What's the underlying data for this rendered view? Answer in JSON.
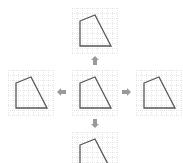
{
  "diagram": {
    "title": "",
    "grid": {
      "cells": 9,
      "cell_size": 5,
      "line_color": "#d8d8d8"
    },
    "shape": {
      "stroke": "#555555",
      "points": [
        [
          8,
          13
        ],
        [
          23,
          7
        ],
        [
          39,
          38
        ],
        [
          8,
          38
        ]
      ]
    },
    "arrow_color": "#9a9a9a",
    "panels": [
      {
        "id": "top",
        "label": "shifted up",
        "x": 72,
        "y": 8
      },
      {
        "id": "left",
        "label": "shifted left",
        "x": 8,
        "y": 70
      },
      {
        "id": "center",
        "label": "original",
        "x": 72,
        "y": 70
      },
      {
        "id": "right",
        "label": "shifted right",
        "x": 136,
        "y": 70
      },
      {
        "id": "bottom",
        "label": "shifted down",
        "x": 72,
        "y": 132
      }
    ],
    "arrows": [
      {
        "id": "up",
        "direction": "up",
        "x": 91,
        "y": 56
      },
      {
        "id": "left",
        "direction": "left",
        "x": 57,
        "y": 88
      },
      {
        "id": "right",
        "direction": "right",
        "x": 122,
        "y": 88
      },
      {
        "id": "down",
        "direction": "down",
        "x": 91,
        "y": 119
      }
    ]
  }
}
